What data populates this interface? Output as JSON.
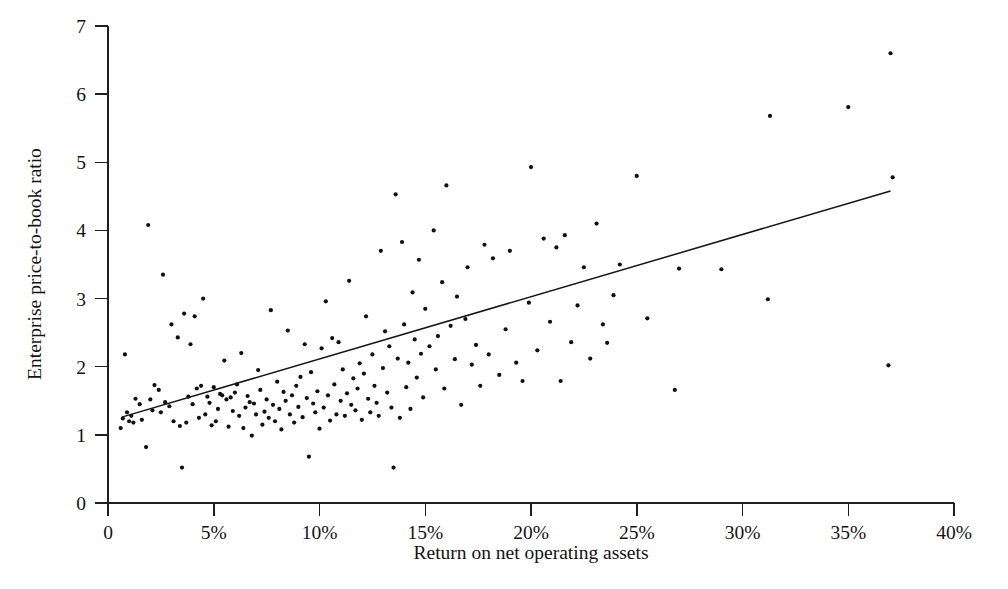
{
  "chart_data": {
    "type": "scatter",
    "title": "",
    "subtitle": "",
    "xlabel": "Return on net operating assets",
    "ylabel": "Enterprise price-to-book ratio",
    "xlim": [
      0,
      40
    ],
    "ylim": [
      0,
      7
    ],
    "x_unit": "%",
    "grid": false,
    "legend": null,
    "x_tick_labels": [
      "0",
      "5%",
      "10%",
      "15%",
      "20%",
      "25%",
      "30%",
      "35%",
      "40%"
    ],
    "x_tick_values": [
      0,
      5,
      10,
      15,
      20,
      25,
      30,
      35,
      40
    ],
    "y_tick_labels": [
      "0",
      "1",
      "2",
      "3",
      "4",
      "5",
      "6",
      "7"
    ],
    "y_tick_values": [
      0,
      1,
      2,
      3,
      4,
      5,
      6,
      7
    ],
    "series": [
      {
        "name": "firms",
        "marker": "filled-circle",
        "marker_color": "#101010",
        "points": [
          [
            0.6,
            1.1
          ],
          [
            0.7,
            1.24
          ],
          [
            0.8,
            2.18
          ],
          [
            0.9,
            1.33
          ],
          [
            1.0,
            1.2
          ],
          [
            1.1,
            1.28
          ],
          [
            1.2,
            1.18
          ],
          [
            1.3,
            1.53
          ],
          [
            1.5,
            1.45
          ],
          [
            1.6,
            1.22
          ],
          [
            1.8,
            0.82
          ],
          [
            1.9,
            4.08
          ],
          [
            2.0,
            1.52
          ],
          [
            2.1,
            1.36
          ],
          [
            2.2,
            1.73
          ],
          [
            2.4,
            1.66
          ],
          [
            2.5,
            1.33
          ],
          [
            2.6,
            3.35
          ],
          [
            2.7,
            1.48
          ],
          [
            2.9,
            1.42
          ],
          [
            3.0,
            2.62
          ],
          [
            3.1,
            1.2
          ],
          [
            3.3,
            2.43
          ],
          [
            3.4,
            1.13
          ],
          [
            3.5,
            0.52
          ],
          [
            3.6,
            2.78
          ],
          [
            3.7,
            1.18
          ],
          [
            3.8,
            1.56
          ],
          [
            3.9,
            2.33
          ],
          [
            4.0,
            1.45
          ],
          [
            4.1,
            2.74
          ],
          [
            4.2,
            1.68
          ],
          [
            4.3,
            1.25
          ],
          [
            4.4,
            1.72
          ],
          [
            4.5,
            3.0
          ],
          [
            4.6,
            1.3
          ],
          [
            4.7,
            1.56
          ],
          [
            4.8,
            1.47
          ],
          [
            4.9,
            1.14
          ],
          [
            5.0,
            1.7
          ],
          [
            5.1,
            1.2
          ],
          [
            5.2,
            1.38
          ],
          [
            5.3,
            1.6
          ],
          [
            5.4,
            1.58
          ],
          [
            5.5,
            2.09
          ],
          [
            5.6,
            1.52
          ],
          [
            5.7,
            1.12
          ],
          [
            5.8,
            1.55
          ],
          [
            5.9,
            1.35
          ],
          [
            6.0,
            1.62
          ],
          [
            6.1,
            1.74
          ],
          [
            6.2,
            1.28
          ],
          [
            6.3,
            2.2
          ],
          [
            6.4,
            1.1
          ],
          [
            6.5,
            1.4
          ],
          [
            6.6,
            1.57
          ],
          [
            6.7,
            1.48
          ],
          [
            6.8,
            0.99
          ],
          [
            6.9,
            1.46
          ],
          [
            7.0,
            1.3
          ],
          [
            7.1,
            1.95
          ],
          [
            7.2,
            1.66
          ],
          [
            7.3,
            1.15
          ],
          [
            7.4,
            1.34
          ],
          [
            7.5,
            1.52
          ],
          [
            7.6,
            1.25
          ],
          [
            7.7,
            2.83
          ],
          [
            7.8,
            1.44
          ],
          [
            7.9,
            1.2
          ],
          [
            8.0,
            1.78
          ],
          [
            8.1,
            1.38
          ],
          [
            8.2,
            1.08
          ],
          [
            8.3,
            1.63
          ],
          [
            8.4,
            1.5
          ],
          [
            8.5,
            2.53
          ],
          [
            8.6,
            1.3
          ],
          [
            8.7,
            1.58
          ],
          [
            8.8,
            1.18
          ],
          [
            8.9,
            1.72
          ],
          [
            9.0,
            1.41
          ],
          [
            9.1,
            1.85
          ],
          [
            9.2,
            1.26
          ],
          [
            9.3,
            2.33
          ],
          [
            9.4,
            1.54
          ],
          [
            9.5,
            0.68
          ],
          [
            9.6,
            1.92
          ],
          [
            9.7,
            1.46
          ],
          [
            9.8,
            1.33
          ],
          [
            9.9,
            1.64
          ],
          [
            10.0,
            1.09
          ],
          [
            10.1,
            2.27
          ],
          [
            10.2,
            1.4
          ],
          [
            10.3,
            2.96
          ],
          [
            10.4,
            1.58
          ],
          [
            10.5,
            1.21
          ],
          [
            10.6,
            2.42
          ],
          [
            10.7,
            1.74
          ],
          [
            10.8,
            1.3
          ],
          [
            10.9,
            2.36
          ],
          [
            11.0,
            1.5
          ],
          [
            11.1,
            1.96
          ],
          [
            11.2,
            1.28
          ],
          [
            11.3,
            1.61
          ],
          [
            11.4,
            3.26
          ],
          [
            11.5,
            1.44
          ],
          [
            11.6,
            1.83
          ],
          [
            11.7,
            1.36
          ],
          [
            11.8,
            1.68
          ],
          [
            11.9,
            2.05
          ],
          [
            12.0,
            1.22
          ],
          [
            12.1,
            1.9
          ],
          [
            12.2,
            2.74
          ],
          [
            12.3,
            1.53
          ],
          [
            12.4,
            1.33
          ],
          [
            12.5,
            2.18
          ],
          [
            12.6,
            1.72
          ],
          [
            12.7,
            1.47
          ],
          [
            12.8,
            1.28
          ],
          [
            12.9,
            3.7
          ],
          [
            13.0,
            1.98
          ],
          [
            13.1,
            2.52
          ],
          [
            13.2,
            1.62
          ],
          [
            13.3,
            2.3
          ],
          [
            13.4,
            1.4
          ],
          [
            13.5,
            0.52
          ],
          [
            13.6,
            4.53
          ],
          [
            13.7,
            2.12
          ],
          [
            13.8,
            1.25
          ],
          [
            13.9,
            3.83
          ],
          [
            14.0,
            2.62
          ],
          [
            14.1,
            1.7
          ],
          [
            14.2,
            2.06
          ],
          [
            14.3,
            1.38
          ],
          [
            14.4,
            3.09
          ],
          [
            14.5,
            2.4
          ],
          [
            14.6,
            1.84
          ],
          [
            14.7,
            3.57
          ],
          [
            14.8,
            2.19
          ],
          [
            14.9,
            1.55
          ],
          [
            15.0,
            2.85
          ],
          [
            15.2,
            2.3
          ],
          [
            15.4,
            4.0
          ],
          [
            15.5,
            1.96
          ],
          [
            15.6,
            2.45
          ],
          [
            15.8,
            3.24
          ],
          [
            15.9,
            1.68
          ],
          [
            16.0,
            4.66
          ],
          [
            16.2,
            2.6
          ],
          [
            16.4,
            2.11
          ],
          [
            16.5,
            3.03
          ],
          [
            16.7,
            1.44
          ],
          [
            16.9,
            2.7
          ],
          [
            17.0,
            3.46
          ],
          [
            17.2,
            2.03
          ],
          [
            17.4,
            2.32
          ],
          [
            17.6,
            1.72
          ],
          [
            17.8,
            3.79
          ],
          [
            18.0,
            2.18
          ],
          [
            18.2,
            3.59
          ],
          [
            18.5,
            1.88
          ],
          [
            18.8,
            2.55
          ],
          [
            19.0,
            3.7
          ],
          [
            19.3,
            2.06
          ],
          [
            19.6,
            1.79
          ],
          [
            19.9,
            2.94
          ],
          [
            20.0,
            4.93
          ],
          [
            20.3,
            2.24
          ],
          [
            20.6,
            3.88
          ],
          [
            20.9,
            2.66
          ],
          [
            21.2,
            3.75
          ],
          [
            21.4,
            1.79
          ],
          [
            21.6,
            3.93
          ],
          [
            21.9,
            2.36
          ],
          [
            22.2,
            2.9
          ],
          [
            22.5,
            3.46
          ],
          [
            22.8,
            2.12
          ],
          [
            23.1,
            4.1
          ],
          [
            23.4,
            2.62
          ],
          [
            23.6,
            2.35
          ],
          [
            23.9,
            3.05
          ],
          [
            24.2,
            3.5
          ],
          [
            25.0,
            4.8
          ],
          [
            25.5,
            2.71
          ],
          [
            26.8,
            1.66
          ],
          [
            27.0,
            3.44
          ],
          [
            29.0,
            3.43
          ],
          [
            31.2,
            2.99
          ],
          [
            31.3,
            5.68
          ],
          [
            35.0,
            5.81
          ],
          [
            36.9,
            2.02
          ],
          [
            37.0,
            6.6
          ],
          [
            37.1,
            4.78
          ]
        ]
      }
    ],
    "trend_line": {
      "name": "fitted regression line",
      "x_start": 0.65,
      "y_start": 1.26,
      "x_end": 37.0,
      "y_end": 4.58,
      "color": "#151515"
    }
  }
}
